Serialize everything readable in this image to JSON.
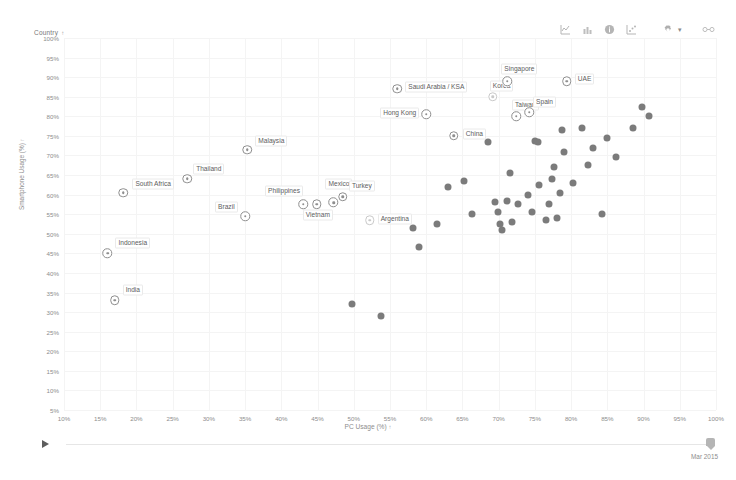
{
  "toolbar": {
    "icons": [
      {
        "name": "line-chart-icon",
        "label": "Line chart"
      },
      {
        "name": "bar-chart-icon",
        "label": "Bar chart"
      },
      {
        "name": "info-icon",
        "label": "Info"
      },
      {
        "name": "scatter-chart-icon",
        "label": "Scatter chart"
      },
      {
        "name": "gear-icon",
        "label": "Settings"
      },
      {
        "name": "link-icon",
        "label": "Share link"
      }
    ],
    "caret": "▾"
  },
  "legend": {
    "country_label": "Country",
    "sort_caret": "↑"
  },
  "slider": {
    "play_label": "Play",
    "current_value": "Mar 2015"
  },
  "chart_data": {
    "type": "scatter",
    "title": "",
    "xlabel": "PC Usage (%)",
    "ylabel": "Smartphone Usage (%)",
    "xlabel_caret": "↑",
    "ylabel_caret": "↑",
    "xlim": [
      10,
      100
    ],
    "ylim": [
      5,
      100
    ],
    "xticks": [
      "10%",
      "15%",
      "20%",
      "25%",
      "30%",
      "35%",
      "40%",
      "45%",
      "50%",
      "55%",
      "60%",
      "65%",
      "70%",
      "75%",
      "80%",
      "85%",
      "90%",
      "95%",
      "100%"
    ],
    "yticks": [
      "5%",
      "10%",
      "15%",
      "20%",
      "25%",
      "30%",
      "35%",
      "40%",
      "45%",
      "50%",
      "55%",
      "60%",
      "65%",
      "70%",
      "75%",
      "80%",
      "85%",
      "90%",
      "95%",
      "100%"
    ],
    "grid": true,
    "legend_position": "none",
    "point_color": "#7b7b7b",
    "labeled_point_color": "#8e8e8e",
    "labeled": [
      {
        "label": "India",
        "x": 17.0,
        "y": 33.0,
        "lx": 8,
        "ly": -10
      },
      {
        "label": "Indonesia",
        "x": 16.0,
        "y": 45.0,
        "lx": 8,
        "ly": -10
      },
      {
        "label": "South Africa",
        "x": 18.2,
        "y": 60.5,
        "lx": 9,
        "ly": -9
      },
      {
        "label": "Thailand",
        "x": 27.0,
        "y": 64.0,
        "lx": 6,
        "ly": -10
      },
      {
        "label": "Brazil",
        "x": 35.0,
        "y": 54.5,
        "lx": -30,
        "ly": -9
      },
      {
        "label": "Malaysia",
        "x": 35.3,
        "y": 71.5,
        "lx": 8,
        "ly": -9
      },
      {
        "label": "Philippines",
        "x": 43.0,
        "y": 57.5,
        "lx": -38,
        "ly": -13
      },
      {
        "label": "Vietnam",
        "x": 44.9,
        "y": 57.5,
        "lx": -14,
        "ly": 11
      },
      {
        "label": "Mexico",
        "x": 47.2,
        "y": 58.0,
        "lx": -8,
        "ly": -18
      },
      {
        "label": "Turkey",
        "x": 48.5,
        "y": 59.5,
        "lx": 6,
        "ly": -11
      },
      {
        "label": "Argentina",
        "x": 52.2,
        "y": 53.5,
        "lx": 8,
        "ly": -1,
        "faint": true
      },
      {
        "label": "Saudi Arabia / KSA",
        "x": 56.0,
        "y": 87.0,
        "lx": 8,
        "ly": -2
      },
      {
        "label": "Hong Kong",
        "x": 60.0,
        "y": 80.5,
        "lx": -46,
        "ly": -1
      },
      {
        "label": "China",
        "x": 63.8,
        "y": 75.0,
        "lx": 9,
        "ly": -2
      },
      {
        "label": "Korea",
        "x": 69.2,
        "y": 85.0,
        "lx": -3,
        "ly": -11,
        "faint": true
      },
      {
        "label": "Singapore",
        "x": 71.2,
        "y": 89.0,
        "lx": -6,
        "ly": -12
      },
      {
        "label": "Taiwan",
        "x": 72.4,
        "y": 80.0,
        "lx": -4,
        "ly": -11
      },
      {
        "label": "Spain",
        "x": 74.2,
        "y": 81.0,
        "lx": 4,
        "ly": -10
      },
      {
        "label": "UAE",
        "x": 79.4,
        "y": 89.0,
        "lx": 8,
        "ly": -2
      }
    ],
    "unlabeled": [
      {
        "x": 49.8,
        "y": 32.0
      },
      {
        "x": 53.8,
        "y": 29.0
      },
      {
        "x": 58.2,
        "y": 51.5
      },
      {
        "x": 59.0,
        "y": 46.5
      },
      {
        "x": 61.5,
        "y": 52.5
      },
      {
        "x": 63.0,
        "y": 62.0
      },
      {
        "x": 65.2,
        "y": 63.5
      },
      {
        "x": 66.3,
        "y": 55.0
      },
      {
        "x": 68.5,
        "y": 73.5
      },
      {
        "x": 69.5,
        "y": 58.0
      },
      {
        "x": 69.9,
        "y": 55.5
      },
      {
        "x": 70.2,
        "y": 52.5
      },
      {
        "x": 70.4,
        "y": 51.0
      },
      {
        "x": 71.2,
        "y": 58.5
      },
      {
        "x": 71.5,
        "y": 65.5
      },
      {
        "x": 71.9,
        "y": 53.0
      },
      {
        "x": 72.6,
        "y": 57.5
      },
      {
        "x": 74.0,
        "y": 60.0
      },
      {
        "x": 74.6,
        "y": 55.5
      },
      {
        "x": 75.0,
        "y": 73.8
      },
      {
        "x": 75.4,
        "y": 73.5
      },
      {
        "x": 75.6,
        "y": 62.5
      },
      {
        "x": 76.5,
        "y": 53.5
      },
      {
        "x": 77.0,
        "y": 57.5
      },
      {
        "x": 77.4,
        "y": 64.0
      },
      {
        "x": 77.6,
        "y": 67.0
      },
      {
        "x": 78.0,
        "y": 54.0
      },
      {
        "x": 78.4,
        "y": 60.5
      },
      {
        "x": 78.8,
        "y": 76.5
      },
      {
        "x": 79.0,
        "y": 71.0
      },
      {
        "x": 80.2,
        "y": 63.0
      },
      {
        "x": 81.5,
        "y": 77.0
      },
      {
        "x": 82.4,
        "y": 67.5
      },
      {
        "x": 83.0,
        "y": 72.0
      },
      {
        "x": 84.2,
        "y": 55.0
      },
      {
        "x": 85.0,
        "y": 74.5
      },
      {
        "x": 86.2,
        "y": 69.5
      },
      {
        "x": 88.5,
        "y": 77.0
      },
      {
        "x": 89.8,
        "y": 82.5
      },
      {
        "x": 90.8,
        "y": 80.0
      }
    ]
  }
}
